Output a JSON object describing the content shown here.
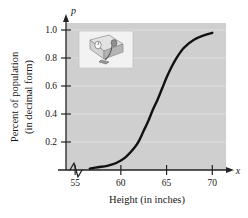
{
  "figure": {
    "background_color": "#ffffff",
    "plot_background_color": "#cfcfcf",
    "gridline_color": "#dedede",
    "axis_color": "#222222",
    "curve_color": "#111111"
  },
  "axes": {
    "y_axis_variable": "p",
    "x_axis_variable": "x",
    "x_axis_title": "Height (in inches)",
    "y_axis_title_line1": "Percent of population",
    "y_axis_title_line2": "(in decimal form)",
    "x_ticks": [
      "55",
      "60",
      "65",
      "70"
    ],
    "y_ticks": [
      "0.2",
      "0.4",
      "0.6",
      "0.8",
      "1.0"
    ],
    "x_axis_break_symbol": "zigzag-break"
  },
  "inset": {
    "name": "bathroom-scale-illustration",
    "description": "grayscale drawing of a weighing scale"
  },
  "chart_data": {
    "type": "line",
    "title": "",
    "subtitle": "",
    "xlabel": "Height (in inches)",
    "ylabel": "Percent of population (in decimal form)",
    "xlim": [
      54.0,
      71.5
    ],
    "ylim": [
      0.0,
      1.05
    ],
    "xticks": [
      55,
      60,
      65,
      70
    ],
    "yticks": [
      0.2,
      0.4,
      0.6,
      0.8,
      1.0
    ],
    "grid": true,
    "legend": "none",
    "axis_break_x": true,
    "series": [
      {
        "name": "Cumulative percent of population",
        "shape": "logistic",
        "midpoint_x": 64.0,
        "x": [
          56.6,
          57.5,
          58.5,
          59.5,
          60.5,
          61.5,
          62.0,
          62.5,
          63.0,
          63.5,
          64.0,
          64.5,
          65.0,
          65.5,
          66.0,
          66.5,
          67.0,
          68.0,
          69.0,
          70.0
        ],
        "y": [
          0.01,
          0.02,
          0.03,
          0.05,
          0.09,
          0.16,
          0.21,
          0.28,
          0.35,
          0.43,
          0.5,
          0.58,
          0.66,
          0.73,
          0.79,
          0.84,
          0.88,
          0.93,
          0.96,
          0.98
        ]
      }
    ]
  }
}
